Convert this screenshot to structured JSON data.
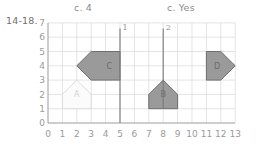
{
  "annotations": {
    "answer_c_number": "c. 4",
    "answer_c_yes": "c. Yes",
    "problem_range": "14-18."
  },
  "chart_data": {
    "type": "scatter",
    "title": "",
    "xlabel": "",
    "ylabel": "",
    "xlim": [
      0,
      13
    ],
    "ylim": [
      0,
      7
    ],
    "grid": true,
    "x_ticks": [
      "0",
      "1",
      "2",
      "3",
      "4",
      "5",
      "6",
      "7",
      "8",
      "9",
      "10",
      "11",
      "12",
      "13"
    ],
    "y_ticks": [
      "0",
      "1",
      "2",
      "3",
      "4",
      "5",
      "6",
      "7"
    ],
    "legend": "none",
    "shapes": [
      {
        "label": "A",
        "style": "outline-faint",
        "fill": "#fbfbfb",
        "stroke": "#dcdcdc",
        "label_x": 2,
        "label_y": 2,
        "points": [
          [
            1,
            1
          ],
          [
            1,
            2
          ],
          [
            2,
            3
          ],
          [
            3,
            2
          ],
          [
            3,
            1
          ]
        ]
      },
      {
        "label": "B",
        "style": "filled",
        "fill": "#9a9a9a",
        "stroke": "#6e6e6e",
        "label_x": 8,
        "label_y": 2,
        "points": [
          [
            7,
            1
          ],
          [
            7,
            2
          ],
          [
            8,
            3
          ],
          [
            9,
            2
          ],
          [
            9,
            1
          ]
        ]
      },
      {
        "label": "C",
        "style": "filled",
        "fill": "#9a9a9a",
        "stroke": "#6e6e6e",
        "label_x": 4.25,
        "label_y": 4,
        "points": [
          [
            3,
            5
          ],
          [
            5,
            5
          ],
          [
            5,
            3
          ],
          [
            3,
            3
          ],
          [
            2,
            4
          ]
        ]
      },
      {
        "label": "D",
        "style": "filled",
        "fill": "#9a9a9a",
        "stroke": "#6e6e6e",
        "label_x": 11.75,
        "label_y": 4,
        "points": [
          [
            11,
            5
          ],
          [
            12,
            5
          ],
          [
            13,
            4
          ],
          [
            12,
            3
          ],
          [
            11,
            3
          ]
        ]
      }
    ],
    "reflection_lines": [
      {
        "label": "1",
        "x": 5,
        "y_bottom": 0,
        "y_top": 6.6
      },
      {
        "label": "2",
        "x": 8,
        "y_bottom": 1,
        "y_top": 6.6
      }
    ],
    "axis_color": "#a8a8a8",
    "grid_color": "#d9d9d9",
    "line_color": "#7a7a7a"
  }
}
